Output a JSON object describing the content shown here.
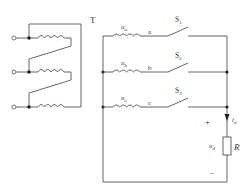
{
  "diagram": {
    "transformer": {
      "label": "T",
      "windings": 3
    },
    "phases": [
      {
        "voltage_symbol": "u",
        "voltage_sub": "a",
        "node": "a",
        "switch_symbol": "S",
        "switch_sub": "1"
      },
      {
        "voltage_symbol": "u",
        "voltage_sub": "b",
        "node": "b",
        "switch_symbol": "S",
        "switch_sub": "2"
      },
      {
        "voltage_symbol": "u",
        "voltage_sub": "c",
        "node": "c",
        "switch_symbol": "S",
        "switch_sub": "3"
      }
    ],
    "load": {
      "resistor_label": "R",
      "voltage_symbol": "u",
      "voltage_sub": "d",
      "current_symbol": "i",
      "current_sub": "d",
      "plus": "+",
      "minus": "−"
    },
    "colors": {
      "wire": "#555555",
      "node": "#222222",
      "background": "#ffffff"
    }
  }
}
